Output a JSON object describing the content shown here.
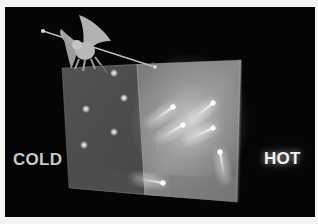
{
  "illustration": {
    "subject": "Maxwell's demon sorting molecules between two chambers",
    "labels": {
      "cold": "COLD",
      "hot": "HOT"
    },
    "elements": {
      "demon": "winged demon holding a long pole, perched on the box",
      "box": "transparent box divided by a central partition",
      "cold_chamber_particles": 5,
      "hot_chamber_particles": 6
    },
    "colors": {
      "background": "#050505",
      "page": "#f4f4f4",
      "box_face": "#5a5a5a",
      "particle_glow": "#ffffff",
      "cold_label": "#c8c8c8",
      "hot_label": "#f2f2f2"
    }
  }
}
